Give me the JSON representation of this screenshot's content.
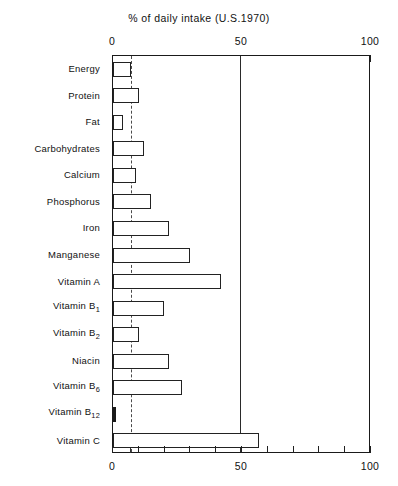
{
  "chart_data": {
    "type": "bar",
    "orientation": "horizontal",
    "title": "% of daily intake (U.S.1970)",
    "xlabel": "",
    "ylabel": "",
    "xlim": [
      0,
      100
    ],
    "xticks": [
      0,
      10,
      20,
      30,
      40,
      50,
      60,
      70,
      80,
      90,
      100
    ],
    "xtick_labels": [
      "0",
      "50",
      "100"
    ],
    "labeled_ticks": [
      0,
      50,
      100
    ],
    "grid": false,
    "legend": null,
    "reference_lines": [
      {
        "value": 7,
        "style": "dashed",
        "name": "reference-line-7"
      },
      {
        "value": 50,
        "style": "solid",
        "name": "reference-line-50"
      }
    ],
    "categories": [
      "Energy",
      "Protein",
      "Fat",
      "Carbohydrates",
      "Calcium",
      "Phosphorus",
      "Iron",
      "Manganese",
      "Vitamin A",
      "Vitamin B1",
      "Vitamin B2",
      "Niacin",
      "Vitamin B6",
      "Vitamin B12",
      "Vitamin C"
    ],
    "values": [
      7,
      10,
      4,
      12,
      9,
      15,
      22,
      30,
      42,
      20,
      10,
      22,
      27,
      1,
      57
    ],
    "bars": [
      {
        "label": "Energy",
        "label_main": "Energy",
        "label_sub": "",
        "value": 7,
        "filled": false
      },
      {
        "label": "Protein",
        "label_main": "Protein",
        "label_sub": "",
        "value": 10,
        "filled": false
      },
      {
        "label": "Fat",
        "label_main": "Fat",
        "label_sub": "",
        "value": 4,
        "filled": false
      },
      {
        "label": "Carbohydrates",
        "label_main": "Carbohydrates",
        "label_sub": "",
        "value": 12,
        "filled": false
      },
      {
        "label": "Calcium",
        "label_main": "Calcium",
        "label_sub": "",
        "value": 9,
        "filled": false
      },
      {
        "label": "Phosphorus",
        "label_main": "Phosphorus",
        "label_sub": "",
        "value": 15,
        "filled": false
      },
      {
        "label": "Iron",
        "label_main": "Iron",
        "label_sub": "",
        "value": 22,
        "filled": false
      },
      {
        "label": "Manganese",
        "label_main": "Manganese",
        "label_sub": "",
        "value": 30,
        "filled": false
      },
      {
        "label": "Vitamin A",
        "label_main": "Vitamin A",
        "label_sub": "",
        "value": 42,
        "filled": false
      },
      {
        "label": "Vitamin B1",
        "label_main": "Vitamin B",
        "label_sub": "1",
        "value": 20,
        "filled": false
      },
      {
        "label": "Vitamin B2",
        "label_main": "Vitamin B",
        "label_sub": "2",
        "value": 10,
        "filled": false
      },
      {
        "label": "Niacin",
        "label_main": "Niacin",
        "label_sub": "",
        "value": 22,
        "filled": false
      },
      {
        "label": "Vitamin B6",
        "label_main": "Vitamin B",
        "label_sub": "6",
        "value": 27,
        "filled": false
      },
      {
        "label": "Vitamin B12",
        "label_main": "Vitamin B",
        "label_sub": "12",
        "value": 1,
        "filled": true
      },
      {
        "label": "Vitamin C",
        "label_main": "Vitamin C",
        "label_sub": "",
        "value": 57,
        "filled": false
      }
    ]
  },
  "colors": {
    "bar_outline": "#222222",
    "bar_fill": "#ffffff",
    "bar_solid": "#1a1a1a",
    "axis": "#1a1a1a",
    "text": "#111111",
    "background": "#ffffff"
  }
}
